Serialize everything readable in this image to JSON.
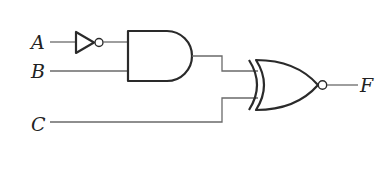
{
  "diagram": {
    "type": "logic-circuit",
    "inputs": [
      {
        "id": "A",
        "label": "A"
      },
      {
        "id": "B",
        "label": "B"
      },
      {
        "id": "C",
        "label": "C"
      }
    ],
    "output": {
      "id": "F",
      "label": "F"
    },
    "gates": [
      {
        "id": "g1",
        "type": "NOT",
        "inputs": [
          "A"
        ]
      },
      {
        "id": "g2",
        "type": "AND",
        "inputs": [
          "g1",
          "B"
        ]
      },
      {
        "id": "g3",
        "type": "XNOR",
        "inputs": [
          "g2",
          "C"
        ],
        "output": "F"
      }
    ],
    "expression": "F = ((NOT A) AND B) XNOR C"
  }
}
